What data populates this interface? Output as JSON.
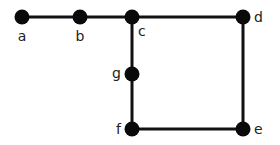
{
  "diagram": {
    "type": "graph",
    "colors": {
      "edge": "#111111",
      "node": "#0a0a0a",
      "label": "#222222",
      "background": "#ffffff"
    },
    "nodes": [
      {
        "id": "a",
        "label": "a",
        "x": 22,
        "y": 17,
        "lx": 22,
        "ly": 41,
        "anchor": "middle"
      },
      {
        "id": "b",
        "label": "b",
        "x": 80,
        "y": 17,
        "lx": 80,
        "ly": 41,
        "anchor": "middle"
      },
      {
        "id": "c",
        "label": "c",
        "x": 132,
        "y": 17,
        "lx": 138,
        "ly": 36,
        "anchor": "start"
      },
      {
        "id": "d",
        "label": "d",
        "x": 243,
        "y": 17,
        "lx": 254,
        "ly": 22,
        "anchor": "start"
      },
      {
        "id": "g",
        "label": "g",
        "x": 132,
        "y": 74,
        "lx": 121,
        "ly": 78,
        "anchor": "end"
      },
      {
        "id": "f",
        "label": "f",
        "x": 132,
        "y": 129,
        "lx": 121,
        "ly": 134,
        "anchor": "end"
      },
      {
        "id": "e",
        "label": "e",
        "x": 243,
        "y": 129,
        "lx": 254,
        "ly": 134,
        "anchor": "start"
      }
    ],
    "edges": [
      {
        "from": "a",
        "to": "b"
      },
      {
        "from": "b",
        "to": "c"
      },
      {
        "from": "c",
        "to": "d"
      },
      {
        "from": "c",
        "to": "g"
      },
      {
        "from": "g",
        "to": "f"
      },
      {
        "from": "f",
        "to": "e"
      },
      {
        "from": "d",
        "to": "e"
      }
    ]
  }
}
